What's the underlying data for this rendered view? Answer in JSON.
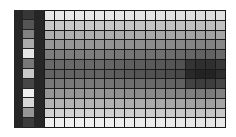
{
  "chart_data": {
    "type": "heatmap",
    "title": "",
    "xlabel": "",
    "ylabel": "",
    "rows": 12,
    "cols": 18,
    "colormap": "grayscale (dark = high, light = low)",
    "legend_strip_gray": [
      55,
      85,
      130,
      170,
      230,
      120,
      200,
      70,
      240,
      215,
      150,
      60
    ],
    "row_base_gray": [
      232,
      200,
      175,
      150,
      125,
      105,
      100,
      120,
      150,
      180,
      210,
      240
    ],
    "col_darken": [
      0,
      0,
      0,
      0,
      0,
      0,
      5,
      8,
      12,
      15,
      18,
      20,
      24,
      28,
      34,
      40,
      40,
      30
    ],
    "hotspot": {
      "rows": [
        5,
        6,
        7
      ],
      "cols": [
        14,
        15,
        16,
        17
      ],
      "extra_darken": 25
    }
  },
  "colors": {
    "frame": "#1c1c1c",
    "legend_block": "#262626",
    "grid_line": "#1a1a1a",
    "background": "#ffffff"
  }
}
